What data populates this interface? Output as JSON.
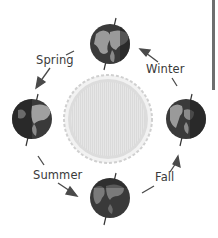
{
  "diagram": {
    "center": {
      "name": "Sun",
      "color": "#e4e4e4",
      "rim_color": "#c9c9c9"
    },
    "planets": [
      {
        "id": "top",
        "position": "top",
        "cx": 110,
        "cy": 44
      },
      {
        "id": "left",
        "position": "left",
        "cx": 32,
        "cy": 119
      },
      {
        "id": "right",
        "position": "right",
        "cx": 186,
        "cy": 119
      },
      {
        "id": "bottom",
        "position": "bottom",
        "cx": 110,
        "cy": 198
      }
    ],
    "seasons": [
      {
        "label": "Spring",
        "x": 36,
        "y": 56,
        "arrow_from": "top",
        "arrow_to": "left"
      },
      {
        "label": "Summer",
        "x": 33,
        "y": 171,
        "arrow_from": "left",
        "arrow_to": "bottom"
      },
      {
        "label": "Fall",
        "x": 155,
        "y": 172,
        "arrow_from": "bottom",
        "arrow_to": "right"
      },
      {
        "label": "Winter",
        "x": 146,
        "y": 63,
        "arrow_from": "right",
        "arrow_to": "top"
      }
    ],
    "colors": {
      "ocean": "#3a3a3a",
      "land": "#9a9a9a",
      "night": "#1e1e1e",
      "arrow": "#4a4a4a",
      "text": "#3a3a3a"
    }
  }
}
